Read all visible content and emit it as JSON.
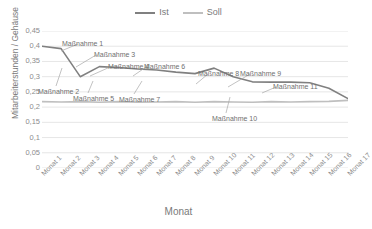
{
  "chart_data": {
    "type": "line",
    "title": "",
    "xlabel": "Monat",
    "ylabel": "Mitarbeiterstunden / Gehäuse",
    "ylim": [
      0,
      0.45
    ],
    "grid": true,
    "legend_position": "top-center",
    "categories": [
      "Monat 1",
      "Monat 2",
      "Monat 3",
      "Monat 4",
      "Monat 5",
      "Monat 6",
      "Monat 7",
      "Monat 8",
      "Monat 9",
      "Monat 10",
      "Monat 11",
      "Monat 12",
      "Monat 13",
      "Monat 14",
      "Monat 15",
      "Monat 16",
      "Monat 17"
    ],
    "y_ticks": [
      "0",
      "0,05",
      "0,1",
      "0,15",
      "0,2",
      "0,25",
      "0,3",
      "0,35",
      "0,4",
      "0,45"
    ],
    "y_tick_values": [
      0,
      0.05,
      0.1,
      0.15,
      0.2,
      0.25,
      0.3,
      0.35,
      0.4,
      0.45
    ],
    "series": [
      {
        "name": "Ist",
        "color": "#808080",
        "values": [
          0.4,
          0.392,
          0.3,
          0.333,
          0.33,
          0.325,
          0.322,
          0.315,
          0.31,
          0.328,
          0.3,
          0.283,
          0.282,
          0.282,
          0.28,
          0.262,
          0.228
        ]
      },
      {
        "name": "Soll",
        "color": "#bfbfbf",
        "values": [
          0.218,
          0.217,
          0.218,
          0.216,
          0.218,
          0.216,
          0.217,
          0.218,
          0.216,
          0.218,
          0.217,
          0.216,
          0.218,
          0.217,
          0.218,
          0.219,
          0.222
        ]
      }
    ],
    "annotations": [
      {
        "label": "Maßnahme 1",
        "x": 62,
        "y": 40,
        "lx1": 78,
        "ly1": 44,
        "lx2": 61,
        "ly2": 51
      },
      {
        "label": "Maßnahme 2",
        "x": 38,
        "y": 88,
        "lx1": 56,
        "ly1": 86,
        "lx2": 62,
        "ly2": 68
      },
      {
        "label": "Maßnahme 3",
        "x": 94,
        "y": 51,
        "lx1": 96,
        "ly1": 55,
        "lx2": 76,
        "ly2": 67
      },
      {
        "label": "Maßnahme 4",
        "x": 108,
        "y": 63,
        "lx1": 110,
        "ly1": 67,
        "lx2": 90,
        "ly2": 76
      },
      {
        "label": "Maßnahme 5",
        "x": 73,
        "y": 95,
        "lx1": 88,
        "ly1": 93,
        "lx2": 93,
        "ly2": 81
      },
      {
        "label": "Maßnahme 6",
        "x": 144,
        "y": 63,
        "lx1": 146,
        "ly1": 67,
        "lx2": 133,
        "ly2": 76
      },
      {
        "label": "Maßnahme 7",
        "x": 119,
        "y": 96,
        "lx1": 134,
        "ly1": 94,
        "lx2": 142,
        "ly2": 81
      },
      {
        "label": "Maßnahme 8",
        "x": 198,
        "y": 70,
        "lx1": 208,
        "ly1": 74,
        "lx2": 196,
        "ly2": 84
      },
      {
        "label": "Maßnahme 9",
        "x": 240,
        "y": 70,
        "lx1": 250,
        "ly1": 74,
        "lx2": 228,
        "ly2": 87
      },
      {
        "label": "Maßnahme 10",
        "x": 212,
        "y": 115,
        "lx1": 226,
        "ly1": 113,
        "lx2": 230,
        "ly2": 97
      },
      {
        "label": "Maßnahme 11",
        "x": 273,
        "y": 83,
        "lx1": 276,
        "ly1": 87,
        "lx2": 262,
        "ly2": 93
      }
    ]
  },
  "legend": {
    "entries": [
      {
        "label": "Ist",
        "color": "#808080"
      },
      {
        "label": "Soll",
        "color": "#bfbfbf"
      }
    ]
  },
  "axes": {
    "x_title": "Monat",
    "y_title": "Mitarbeiterstunden / Gehäuse"
  }
}
